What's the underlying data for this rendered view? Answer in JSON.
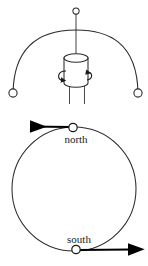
{
  "figure": {
    "stroke_color": "#2b2b2b",
    "accent_color": "#000000",
    "background_color": "#ffffff",
    "width": 148,
    "height": 266
  },
  "upper_panel": {
    "name": "pendulum-over-axis",
    "pivot": {
      "label": "pivot-point",
      "cx": 76,
      "cy": 11,
      "r": 3.1
    },
    "suspension_line": {
      "x1": 76,
      "y1": 14,
      "x2": 76,
      "y2": 56
    },
    "swing_arc": {
      "left_x": 12,
      "left_y": 92,
      "right_x": 139,
      "right_y": 92,
      "apex_x": 76,
      "apex_y": 30
    },
    "bobs": [
      {
        "label": "left-bob",
        "cx": 13,
        "cy": 93,
        "r": 4.1
      },
      {
        "label": "right-bob",
        "cx": 138,
        "cy": 93,
        "r": 4.1
      }
    ],
    "cylinder": {
      "label": "rotating-cylinder",
      "left": 64,
      "right": 89,
      "top": 56,
      "bottom": 83,
      "cap_ry": 4.2
    },
    "axis_lines": [
      {
        "x1": 69,
        "y1": 83,
        "x2": 69,
        "y2": 103
      },
      {
        "x1": 85,
        "y1": 83,
        "x2": 85,
        "y2": 103
      }
    ],
    "rotation_indicator": {
      "label": "rotation-arrows",
      "cx": 76,
      "cy": 76,
      "rx": 16,
      "ry": 5
    }
  },
  "lower_panel": {
    "name": "earth-rotation-circle",
    "circle": {
      "label": "earth-circle",
      "cx": 74,
      "cy": 189,
      "r": 62
    },
    "points": [
      {
        "id": "north",
        "label": "north",
        "marker_cx": 73,
        "marker_cy": 128,
        "marker_r": 4.2,
        "label_x": 76,
        "label_y": 142,
        "arrow": {
          "direction": "left",
          "x_start": 69,
          "x_end": 29,
          "y": 127
        }
      },
      {
        "id": "south",
        "label": "south",
        "marker_cx": 76,
        "marker_cy": 249,
        "marker_r": 4.2,
        "label_x": 79,
        "label_y": 243,
        "arrow": {
          "direction": "right",
          "x_start": 80,
          "x_end": 131,
          "y": 250
        }
      }
    ]
  }
}
